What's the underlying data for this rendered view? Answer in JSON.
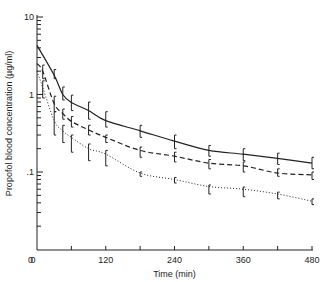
{
  "chart_data": {
    "type": "line",
    "title": "",
    "xlabel": "Time (min)",
    "ylabel": "Propofol blood concentration (µg/ml)",
    "xlim": [
      0,
      480
    ],
    "ylim": [
      0.01,
      10
    ],
    "yscale": "log",
    "grid": false,
    "legend": null,
    "x_ticks": [
      0,
      60,
      120,
      180,
      240,
      300,
      360,
      420,
      480
    ],
    "x_tick_labels": [
      "0",
      "",
      "120",
      "",
      "240",
      "",
      "360",
      "",
      "480"
    ],
    "y_tick_labels": [
      {
        "value": 10,
        "label": "10"
      },
      {
        "value": 1,
        "label": "1"
      },
      {
        "value": 0.1,
        "label": ".1"
      },
      {
        "value": 0.01,
        "label": "0"
      }
    ],
    "series": [
      {
        "name": "Series 1 (solid)",
        "style": "solid",
        "x": [
          0,
          30,
          45,
          60,
          90,
          120,
          180,
          240,
          300,
          360,
          420,
          480
        ],
        "values": [
          4.3,
          1.77,
          1.0,
          0.79,
          0.62,
          0.46,
          0.34,
          0.25,
          0.19,
          0.17,
          0.15,
          0.13
        ],
        "error_x": [
          30,
          45,
          60,
          90,
          120,
          180,
          240,
          300,
          360,
          420,
          480
        ],
        "error_upper": [
          2.1,
          1.25,
          0.98,
          0.8,
          0.6,
          0.4,
          0.3,
          0.22,
          0.2,
          0.175,
          0.155
        ],
        "error_lower": [
          1.6,
          0.85,
          0.62,
          0.48,
          0.38,
          0.28,
          0.2,
          0.16,
          0.14,
          0.125,
          0.11
        ]
      },
      {
        "name": "Series 2 (dashed)",
        "style": "dashed",
        "x": [
          0,
          10,
          30,
          45,
          60,
          90,
          120,
          180,
          240,
          300,
          360,
          420,
          480
        ],
        "values": [
          2.5,
          2.0,
          0.76,
          0.57,
          0.45,
          0.35,
          0.28,
          0.19,
          0.16,
          0.13,
          0.12,
          0.097,
          0.092
        ],
        "error_x": [
          10,
          30,
          45,
          60,
          90,
          120,
          180,
          240,
          300,
          360,
          420,
          480
        ],
        "error_upper": [
          2.4,
          0.95,
          0.65,
          0.52,
          0.4,
          0.3,
          0.21,
          0.18,
          0.145,
          0.135,
          0.11,
          0.1
        ],
        "error_lower": [
          1.6,
          0.6,
          0.48,
          0.38,
          0.3,
          0.24,
          0.155,
          0.135,
          0.11,
          0.1,
          0.088,
          0.08
        ]
      },
      {
        "name": "Series 3 (dotted)",
        "style": "dotted",
        "x": [
          0,
          10,
          30,
          45,
          60,
          90,
          120,
          180,
          240,
          300,
          360,
          420,
          480
        ],
        "values": [
          2.0,
          1.23,
          0.46,
          0.34,
          0.28,
          0.2,
          0.17,
          0.097,
          0.08,
          0.065,
          0.06,
          0.052,
          0.042
        ],
        "error_x": [
          10,
          30,
          45,
          60,
          90,
          120,
          180,
          240,
          300,
          360,
          420,
          480
        ],
        "error_upper": [
          1.5,
          0.6,
          0.4,
          0.3,
          0.23,
          0.19,
          0.1,
          0.085,
          0.068,
          0.064,
          0.055,
          0.045
        ],
        "error_lower": [
          0.9,
          0.3,
          0.24,
          0.18,
          0.14,
          0.12,
          0.088,
          0.072,
          0.052,
          0.048,
          0.045,
          0.038
        ]
      }
    ]
  },
  "layout": {
    "plot_left": 37,
    "plot_right": 312,
    "plot_top": 17,
    "plot_bottom": 250,
    "decade_px": 77.5
  }
}
